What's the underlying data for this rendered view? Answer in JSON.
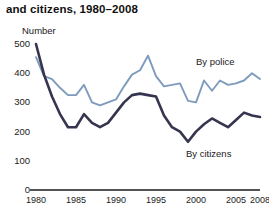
{
  "title": "and citizens, 1980–2008",
  "axis": {
    "y_label": "Number",
    "y_ticks": [
      "0",
      "100",
      "200",
      "300",
      "400",
      "500"
    ],
    "x_ticks": [
      "1980",
      "1985",
      "1990",
      "1995",
      "2000",
      "2005",
      "2008"
    ]
  },
  "legend": {
    "police": "By police",
    "citizens": "By citizens"
  },
  "colors": {
    "police": "#7e9bbd",
    "citizens": "#35354f",
    "axis": "#1a1a1a",
    "background": "#ffffff"
  },
  "chart_data": {
    "type": "line",
    "title": "and citizens, 1980–2008",
    "subtitle": "",
    "xlabel": "",
    "ylabel": "Number",
    "ylim": [
      0,
      500
    ],
    "xlim": [
      1980,
      2008
    ],
    "grid": false,
    "legend_position": "inline-annotation",
    "x": [
      1980,
      1981,
      1982,
      1983,
      1984,
      1985,
      1986,
      1987,
      1988,
      1989,
      1990,
      1991,
      1992,
      1993,
      1994,
      1995,
      1996,
      1997,
      1998,
      1999,
      2000,
      2001,
      2002,
      2003,
      2004,
      2005,
      2006,
      2007,
      2008
    ],
    "series": [
      {
        "name": "By police",
        "color": "#7e9bbd",
        "values": [
          455,
          390,
          380,
          350,
          325,
          325,
          360,
          300,
          290,
          300,
          310,
          355,
          395,
          410,
          460,
          390,
          355,
          360,
          365,
          305,
          300,
          375,
          340,
          375,
          360,
          365,
          375,
          400,
          380
        ]
      },
      {
        "name": "By citizens",
        "color": "#35354f",
        "values": [
          500,
          395,
          320,
          260,
          215,
          215,
          260,
          230,
          215,
          230,
          265,
          300,
          325,
          330,
          325,
          320,
          255,
          215,
          200,
          165,
          200,
          225,
          245,
          230,
          215,
          240,
          265,
          255,
          250
        ]
      }
    ],
    "annotations": [
      {
        "text": "By police",
        "x": 2002,
        "y": 425
      },
      {
        "text": "By citizens",
        "x": 2001,
        "y": 115
      }
    ]
  }
}
